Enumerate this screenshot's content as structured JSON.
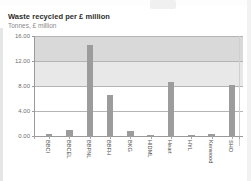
{
  "header": {
    "title": "Waste recycled per £ million",
    "subtitle": "Tonnes, £ million"
  },
  "chart_data": {
    "type": "bar",
    "title": "Waste recycled per £ million",
    "subtitle": "Tonnes, £ million",
    "xlabel": "",
    "ylabel": "Tonnes, £ million",
    "ylim": [
      0,
      16
    ],
    "yticks": [
      "0.00",
      "4.00",
      "8.00",
      "12.00",
      "16.00"
    ],
    "ytick_values": [
      0,
      4,
      8,
      12,
      16
    ],
    "grid": true,
    "legend": "none",
    "bar_color": "#9c9c9c",
    "categories": [
      "BBCI",
      "BBCEL",
      "BBPNL",
      "BBFH",
      "BKG",
      "HIDML",
      "Heart",
      "HYL",
      "Kenwood",
      "SHO"
    ],
    "values": [
      0.3,
      1.0,
      14.5,
      6.5,
      0.8,
      0.1,
      8.6,
      0.1,
      0.3,
      8.2
    ]
  }
}
